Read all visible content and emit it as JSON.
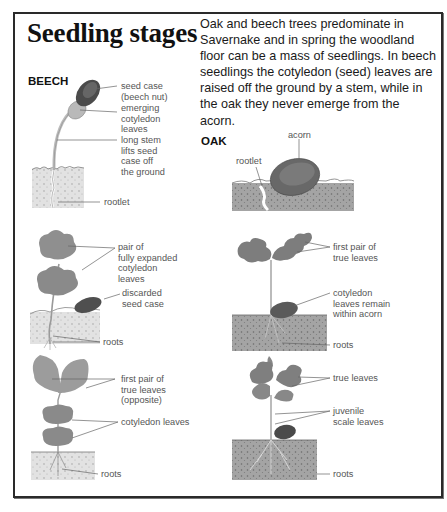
{
  "title": "Seedling stages",
  "intro": "Oak and beech trees predominate in Savernake and in spring the woodland floor can be a mass of seedlings. In beech seedlings the cotyledon (seed) leaves are raised off the ground by a stem, while in the oak they never emerge from the acorn.",
  "beech": {
    "heading": "BEECH",
    "stage1": {
      "labels": [
        "seed case\n(beech nut)",
        "emerging\ncotyledon\nleaves",
        "long stem\nlifts seed\ncase off\nthe ground",
        "rootlet"
      ]
    },
    "stage2": {
      "labels": [
        "pair of\nfully expanded\ncotyledon\nleaves",
        "discarded\nseed case",
        "roots"
      ]
    },
    "stage3": {
      "labels": [
        "first pair of\ntrue leaves\n(opposite)",
        "cotyledon leaves",
        "roots"
      ]
    }
  },
  "oak": {
    "heading": "OAK",
    "stage1": {
      "labels": [
        "acorn",
        "rootlet"
      ]
    },
    "stage2": {
      "labels": [
        "first pair of\ntrue leaves",
        "cotyledon\nleaves remain\nwithin acorn",
        "roots"
      ]
    },
    "stage3": {
      "labels": [
        "true leaves",
        "juvenile\nscale leaves",
        "roots"
      ]
    }
  },
  "colors": {
    "border": "#2a2a2a",
    "leaf": "#8c8c8c",
    "soil": "#9a9a9a",
    "seed": "#4a4a4a",
    "label": "#555555"
  }
}
